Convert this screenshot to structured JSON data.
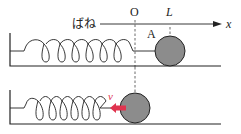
{
  "labels": {
    "spring": "ばね",
    "origin": "O",
    "length": "L",
    "axis": "x",
    "ball": "A",
    "velocity": "v"
  },
  "colors": {
    "ball_fill": "#8c8c8c",
    "line": "#222222",
    "arrow": "#e0344f"
  }
}
